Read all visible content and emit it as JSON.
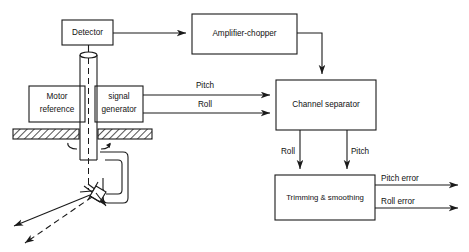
{
  "diagram": {
    "background_color": "#ffffff",
    "line_color": "#1a1a1a",
    "blocks": [
      {
        "id": "detector",
        "label": "Detector"
      },
      {
        "id": "amplifier",
        "label": "Amplifier-chopper"
      },
      {
        "id": "motor",
        "label_line1": "Motor",
        "label_line2": "reference"
      },
      {
        "id": "siggen",
        "label_line1": "signal",
        "label_line2": "generator"
      },
      {
        "id": "separator",
        "label": "Channel separator"
      },
      {
        "id": "trimming",
        "label": "Trimming & smoothing"
      }
    ],
    "signal_labels": {
      "pitch_in": "Pitch",
      "roll_in": "Roll",
      "roll_mid": "Roll",
      "pitch_mid": "Pitch"
    },
    "outputs": [
      {
        "id": "pitch-error",
        "label": "Pitch error"
      },
      {
        "id": "roll-error",
        "label": "Roll error"
      }
    ]
  }
}
